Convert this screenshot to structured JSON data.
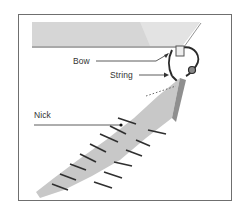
{
  "figure": {
    "labels": {
      "bow": "Bow",
      "string": "String",
      "nick": "Nick"
    },
    "colors": {
      "frame": "#6f6f6f",
      "fabric": "#c9c9c9",
      "fabric_shadow": "#9a9a9a",
      "ink": "#2a2a2a",
      "hull": "#d8d8d8"
    }
  }
}
